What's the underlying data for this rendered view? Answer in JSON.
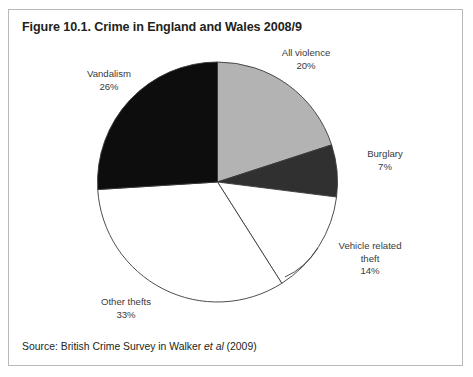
{
  "figure": {
    "title": "Figure 10.1. Crime in England and Wales 2008/9",
    "source_prefix": "Source: British Crime Survey in Walker ",
    "source_italic": "et al",
    "source_suffix": " (2009)"
  },
  "labels": {
    "all_violence": {
      "name": "All violence",
      "pct": "20%"
    },
    "vandalism": {
      "name": "Vandalism",
      "pct": "26%"
    },
    "burglary": {
      "name": "Burglary",
      "pct": "7%"
    },
    "vehicle_theft": {
      "name": "Vehicle related",
      "name2": "theft",
      "pct": "14%"
    },
    "other_thefts": {
      "name": "Other thefts",
      "pct": "33%"
    }
  },
  "colors": {
    "all_violence": "#b3b3b3",
    "burglary": "#303030",
    "vehicle_theft": "#ffffff",
    "other_thefts": "#ffffff",
    "vandalism": "#0d0d0d",
    "outline": "#3a3a3c",
    "frame": "#b9b9bb",
    "text": "#231f20",
    "label_text": "#3a3a3c",
    "background": "#ffffff"
  },
  "chart_data": {
    "type": "pie",
    "title": "Figure 10.1. Crime in England and Wales 2008/9",
    "subtitle": "",
    "xlabel": "",
    "ylabel": "",
    "legend_position": "none",
    "labels_position": "outside",
    "grid": false,
    "start_angle_deg": 0,
    "direction": "clockwise",
    "categories": [
      "All violence",
      "Burglary",
      "Vehicle related theft",
      "Other thefts",
      "Vandalism"
    ],
    "values": [
      20,
      7,
      14,
      33,
      26
    ],
    "unit": "percent",
    "total": 100,
    "slice_colors": [
      "#b3b3b3",
      "#303030",
      "#ffffff",
      "#ffffff",
      "#0d0d0d"
    ],
    "data_labels": [
      "20%",
      "7%",
      "14%",
      "33%",
      "26%"
    ],
    "annotations": [
      "Source: British Crime Survey in Walker et al (2009)"
    ]
  }
}
